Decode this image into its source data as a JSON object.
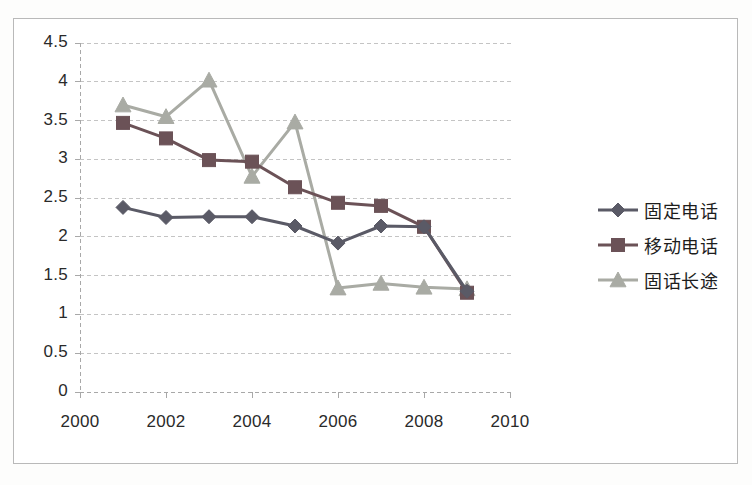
{
  "chart_data": {
    "type": "line",
    "title": "",
    "subtitle": "",
    "xlabel": "",
    "ylabel": "",
    "x": [
      2001,
      2002,
      2003,
      2004,
      2005,
      2006,
      2007,
      2008,
      2009
    ],
    "xlim": [
      2000,
      2010
    ],
    "ylim": [
      0,
      4.5
    ],
    "grid": true,
    "legend_position": "right",
    "xticks": [
      "2000",
      "2002",
      "2004",
      "2006",
      "2008",
      "2010"
    ],
    "xtick_values": [
      2000,
      2002,
      2004,
      2006,
      2008,
      2010
    ],
    "yticks": [
      "0",
      "0.5",
      "1",
      "1.5",
      "2",
      "2.5",
      "3",
      "3.5",
      "4",
      "4.5"
    ],
    "ytick_values": [
      0,
      0.5,
      1,
      1.5,
      2,
      2.5,
      3,
      3.5,
      4,
      4.5
    ],
    "series": [
      {
        "name": "固定电话",
        "marker": "diamond",
        "color": "#5a5a66",
        "values": [
          2.38,
          2.25,
          2.26,
          2.26,
          2.14,
          1.92,
          2.14,
          2.13,
          1.3
        ]
      },
      {
        "name": "移动电话",
        "marker": "square",
        "color": "#6b5257",
        "values": [
          3.47,
          3.27,
          2.99,
          2.97,
          2.64,
          2.44,
          2.4,
          2.13,
          1.28
        ]
      },
      {
        "name": "固话长途",
        "marker": "triangle",
        "color": "#a9aba4",
        "values": [
          3.7,
          3.55,
          4.02,
          2.78,
          3.48,
          1.34,
          1.4,
          1.35,
          1.33
        ]
      }
    ]
  },
  "legend": {
    "items": [
      {
        "label": "固定电话"
      },
      {
        "label": "移动电话"
      },
      {
        "label": "固话长途"
      }
    ]
  },
  "colors": {
    "gridline": "#c4c4c4",
    "axis": "#a8a8a8",
    "frame": "#b9b9b9",
    "text": "#2a2a2a",
    "background": "#ffffff"
  }
}
